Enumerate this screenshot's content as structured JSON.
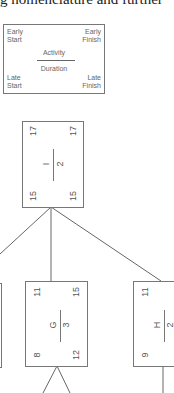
{
  "caption": "g nomenclature and further",
  "legend": {
    "early_start": "Early\nStart",
    "early_finish": "Early\nFinish",
    "activity": "Activity",
    "duration": "Duration",
    "late_start": "Late\nStart",
    "late_finish": "Late\nFinish"
  },
  "nodes": [
    {
      "id": "I",
      "activity": "I",
      "duration": "2",
      "es": "15",
      "ef": "17",
      "ls": "15",
      "lf": "17"
    },
    {
      "id": "G",
      "activity": "G",
      "duration": "3",
      "es": "8",
      "ef": "11",
      "ls": "12",
      "lf": "15"
    },
    {
      "id": "H",
      "activity": "H",
      "duration": "2",
      "es": "9",
      "ef": "11",
      "ls": "",
      "lf": ""
    }
  ],
  "colors": {
    "line": "#777777",
    "text": "#555555"
  }
}
